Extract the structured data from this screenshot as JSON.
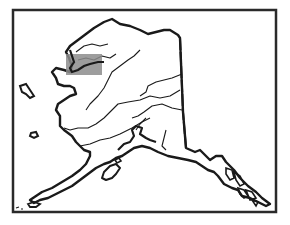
{
  "map": {
    "subject": "Alaska outline map",
    "colors": {
      "background": "#ffffff",
      "line": "#1a1a1a",
      "frame": "#2a2a2a",
      "highlight": "#8c8c8c"
    },
    "frame": {
      "x": 13,
      "y": 10,
      "width": 263,
      "height": 202
    },
    "highlight_box": {
      "x": 66,
      "y": 54,
      "width": 36,
      "height": 21,
      "opacity": 0.85
    },
    "features": [
      "coastline",
      "rivers",
      "canada-border",
      "highlighted-region"
    ]
  }
}
